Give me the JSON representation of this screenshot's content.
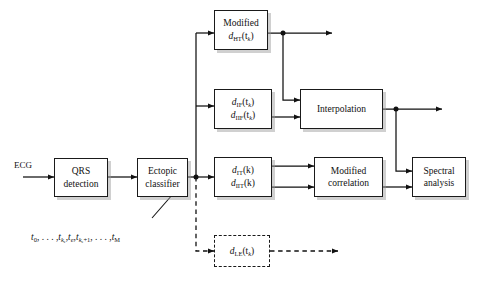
{
  "diagram": {
    "ink_color": "#111111",
    "box_fill": "#ffffff",
    "shadow_color": "#969696",
    "input_label": "ECG",
    "blocks": {
      "qrs": {
        "line1": "QRS",
        "line2": "detection"
      },
      "ectopic": {
        "line1": "Ectopic",
        "line2": "classifier"
      },
      "modified_ht": {
        "line1": "Modified",
        "line2": "d",
        "sub2": "HT",
        "arg2": "(t",
        "argsub2": "k",
        "argend2": ")"
      },
      "if_block": {
        "line1": "d",
        "sub1": "IF",
        "arg1": "(t",
        "argsub1": "k",
        "argend1": ")",
        "line2": "d",
        "sub2": "IIF",
        "arg2": "(t",
        "argsub2": "k",
        "argend2": ")"
      },
      "it_block": {
        "line1": "d",
        "sub1": "IT",
        "arg1": "(k)",
        "line2": "d",
        "sub2": "IIT",
        "arg2": "(k)"
      },
      "le_block": {
        "line1": "d",
        "sub1": "LE",
        "arg1": "(t",
        "argsub1": "k",
        "argend1": ")"
      },
      "interpolation": {
        "line1": "Interpolation"
      },
      "modified_correlation": {
        "line1": "Modified",
        "line2": "correlation"
      },
      "spectral": {
        "line1": "Spectral",
        "line2": "analysis"
      }
    },
    "beat_sequence": {
      "t0": "t",
      "t0sub": "0",
      "dots1": ", . . . ,",
      "tke": "t",
      "tkesub": "k",
      "tkesub2": "e",
      "te": "t",
      "tesub": "e",
      "tke1": "t",
      "tke1sub": "k",
      "tke1sub2": "e",
      "tke1plus": "+1",
      "dots2": ", . . . ,",
      "tM": "t",
      "tMsub": "M",
      "comma": ","
    }
  }
}
